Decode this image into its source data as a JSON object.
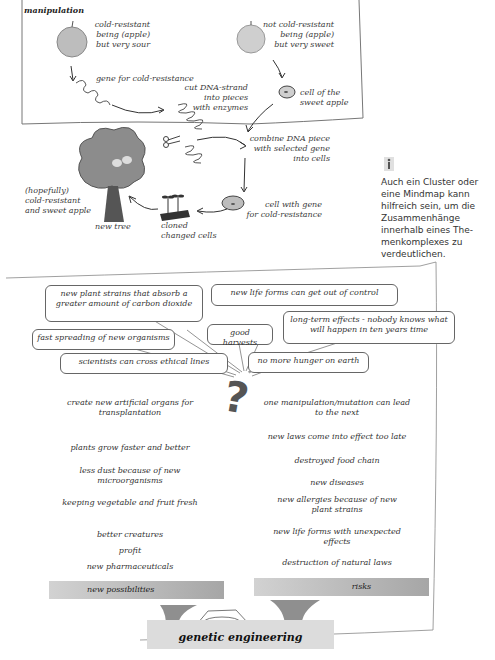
{
  "diagram": {
    "title": "manipulation",
    "apple_left": {
      "label_lines": [
        "cold-resistant",
        "being (apple)",
        "but very sour"
      ]
    },
    "apple_right": {
      "label_lines": [
        "not cold-resistant",
        "being (apple)",
        "but very sweet"
      ]
    },
    "gene_label": "gene for cold-resistance",
    "cut_label": [
      "cut DNA-strand",
      "into pieces",
      "with enzymes"
    ],
    "sweet_cell_label": [
      "cell of the",
      "sweet apple"
    ],
    "combine_label": [
      "combine DNA piece",
      "with selected gene",
      "into cells"
    ],
    "gene_cell_label": [
      "cell with gene",
      "for cold-resistance"
    ],
    "cloned_label": [
      "cloned",
      "changed cells"
    ],
    "new_tree_label": "new tree",
    "result_label": [
      "(hopefully)",
      "cold-resistant",
      "and sweet apple"
    ]
  },
  "side_note": {
    "icon": "info-icon",
    "text": "Auch ein Cluster oder eine Mindmap kann hilfreich sein, um die Zusammenhänge innerhalb eines Themenkomplexes zu verdeutlichen.",
    "lines": [
      "Auch ein Cluster oder",
      "eine Mindmap kann",
      "hilfreich sein, um die",
      "Zusammenhänge",
      "innerhalb eines The-",
      "menkomplexes zu",
      "verdeutlichen."
    ]
  },
  "mindmap": {
    "center_symbol": "?",
    "bubbles": [
      {
        "text": [
          "new plant strains that absorb a",
          "greater amount of carbon dioxide"
        ]
      },
      {
        "text": [
          "new life forms can get out of control"
        ]
      },
      {
        "text": [
          "fast spreading of new organisms"
        ]
      },
      {
        "text": [
          "good harvests"
        ]
      },
      {
        "text": [
          "long-term effects - nobody knows what",
          "will happen in ten years time"
        ]
      },
      {
        "text": [
          "scientists can cross ethical lines"
        ]
      },
      {
        "text": [
          "no more hunger on earth"
        ]
      }
    ],
    "possibilities": [
      "create new artificial organs for transplantation",
      "plants grow faster and better",
      "less dust because of new microorganisms",
      "keeping vegetable and fruit fresh",
      "better creatures",
      "profit",
      "new pharmaceuticals"
    ],
    "risks": [
      "one manipulation/mutation can lead to the next",
      "new laws come into effect too late",
      "destroyed food chain",
      "new diseases",
      "new allergies because of new plant strains",
      "new life forms with unexpected effects",
      "destruction of natural laws"
    ]
  },
  "scale": {
    "left_label": "new possibilities",
    "right_label": "risks",
    "base_label": "genetic engineering"
  }
}
